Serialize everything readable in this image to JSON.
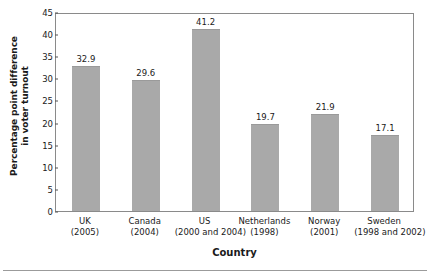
{
  "chart_data": {
    "type": "bar",
    "title": "",
    "xlabel": "Country",
    "ylabel_line1": "Percentage point difference",
    "ylabel_line2": "in voter turnout",
    "categories": [
      {
        "name": "UK",
        "year": "(2005)"
      },
      {
        "name": "Canada",
        "year": "(2004)"
      },
      {
        "name": "US",
        "year": "(2000 and 2004)"
      },
      {
        "name": "Netherlands",
        "year": "(1998)"
      },
      {
        "name": "Norway",
        "year": "(2001)"
      },
      {
        "name": "Sweden",
        "year": "(1998 and 2002)"
      }
    ],
    "values": [
      32.9,
      29.6,
      41.2,
      19.7,
      21.9,
      17.1
    ],
    "value_labels": [
      "32.9",
      "29.6",
      "41.2",
      "19.7",
      "21.9",
      "17.1"
    ],
    "ylim": [
      0,
      45
    ],
    "yticks": [
      0,
      5,
      10,
      15,
      20,
      25,
      30,
      35,
      40,
      45
    ],
    "ytick_labels": [
      "0",
      "5",
      "10",
      "15",
      "20",
      "25",
      "30",
      "35",
      "40",
      "45"
    ],
    "grid": false,
    "legend": null,
    "bar_color": "#a9a9a9",
    "frame_color": "#8a8a8a",
    "text_color": "#1a1a1a"
  }
}
